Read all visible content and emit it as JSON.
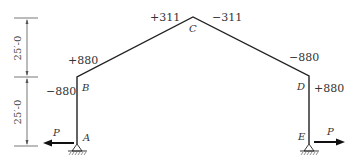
{
  "diagram": {
    "type": "gable-frame-moment-diagram",
    "dimensions": {
      "upper": "25′-0",
      "lower": "25′-0"
    },
    "points": {
      "A": "A",
      "B": "B",
      "C": "C",
      "D": "D",
      "E": "E"
    },
    "values": {
      "B_outer": "+880",
      "B_inner": "−880",
      "C_left": "+311",
      "C_right": "−311",
      "D_outer": "−880",
      "D_inner": "+880"
    },
    "loads": {
      "left": "P",
      "right": "P"
    },
    "colors": {
      "line": "#222222",
      "text": "#333333"
    }
  }
}
